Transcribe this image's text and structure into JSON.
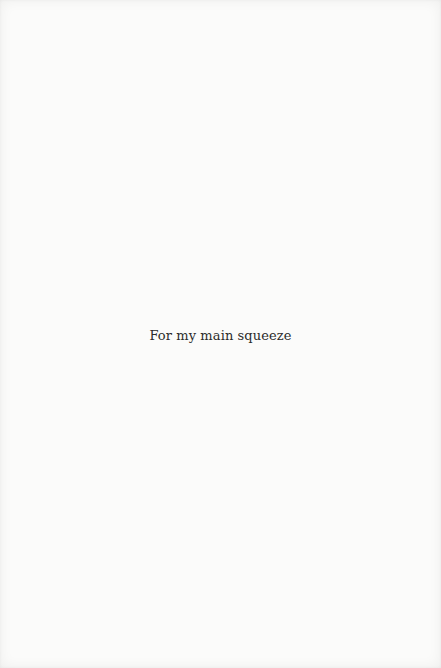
{
  "page": {
    "background": "#fbfbfa",
    "text_color": "#2b2b2b",
    "dedication": "For my main squeeze"
  }
}
